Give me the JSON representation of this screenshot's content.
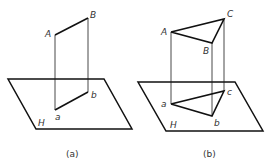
{
  "figures": [
    {
      "id": "a",
      "caption": "(a)",
      "plane_label": "H",
      "points": {
        "A": "A",
        "B": "B",
        "a": "a",
        "b": "b"
      }
    },
    {
      "id": "b",
      "caption": "(b)",
      "plane_label": "H",
      "points": {
        "A": "A",
        "B": "B",
        "C": "C",
        "a": "a",
        "b": "b",
        "c": "c"
      }
    }
  ]
}
